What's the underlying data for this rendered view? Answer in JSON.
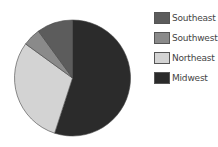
{
  "chart_data": {
    "type": "pie",
    "title": "",
    "categories": [
      "Midwest",
      "Northeast",
      "Southwest",
      "Southeast"
    ],
    "values": [
      55,
      30,
      5,
      10
    ],
    "unit": "%",
    "start_angle_deg": 0,
    "direction": "clockwise",
    "colors": {
      "Midwest": "#2b2b2b",
      "Northeast": "#d3d3d3",
      "Southwest": "#8a8a8a",
      "Southeast": "#5c5c5c"
    },
    "legend": {
      "position": "right",
      "entries": [
        "Southeast",
        "Southwest",
        "Northeast",
        "Midwest"
      ]
    }
  },
  "legend": {
    "items": [
      {
        "label": "Southeast",
        "color": "#5c5c5c"
      },
      {
        "label": "Southwest",
        "color": "#8a8a8a"
      },
      {
        "label": "Northeast",
        "color": "#d3d3d3"
      },
      {
        "label": "Midwest",
        "color": "#2b2b2b"
      }
    ]
  }
}
